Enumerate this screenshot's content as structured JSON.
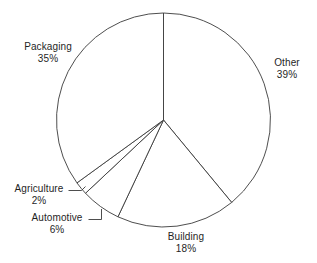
{
  "chart_data": {
    "type": "pie",
    "title": "",
    "subtitle": "",
    "xlabel": "",
    "ylabel": "",
    "legend_position": "none",
    "grid": false,
    "labels_show_percent": true,
    "start_angle_deg": 0,
    "direction": "clockwise",
    "categories": [
      "Other",
      "Building",
      "Automotive",
      "Agriculture",
      "Packaging"
    ],
    "values": [
      39,
      18,
      6,
      2,
      35
    ],
    "units": "%",
    "slices": [
      {
        "label": "Other",
        "value": 39,
        "value_text": "39%",
        "start_deg": 0.0,
        "end_deg": 140.4,
        "leader": false
      },
      {
        "label": "Building",
        "value": 18,
        "value_text": "18%",
        "start_deg": 140.4,
        "end_deg": 205.2,
        "leader": false
      },
      {
        "label": "Automotive",
        "value": 6,
        "value_text": "6%",
        "start_deg": 205.2,
        "end_deg": 226.8,
        "leader": true
      },
      {
        "label": "Agriculture",
        "value": 2,
        "value_text": "2%",
        "start_deg": 226.8,
        "end_deg": 234.0,
        "leader": true
      },
      {
        "label": "Packaging",
        "value": 35,
        "value_text": "35%",
        "start_deg": 234.0,
        "end_deg": 360.0,
        "leader": false
      }
    ]
  },
  "labels": {
    "packaging": {
      "name": "Packaging",
      "value": "35%"
    },
    "other": {
      "name": "Other",
      "value": "39%"
    },
    "building": {
      "name": "Building",
      "value": "18%"
    },
    "agriculture": {
      "name": "Agriculture",
      "value": "2%"
    },
    "automotive": {
      "name": "Automotive",
      "value": "6%"
    }
  },
  "colors": {
    "slice_fill": "#ffffff",
    "slice_stroke": "#3a3a3a",
    "text": "#1f1f1f",
    "background": "#ffffff"
  }
}
